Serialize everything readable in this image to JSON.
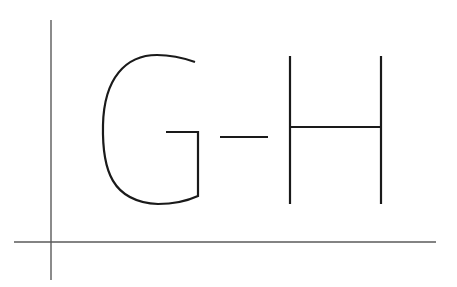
{
  "diagram": {
    "text": "G-H",
    "letters": [
      {
        "char": "G",
        "role": "first-letter"
      },
      {
        "char": "-",
        "role": "hyphen"
      },
      {
        "char": "H",
        "role": "second-letter"
      }
    ],
    "colors": {
      "background": "#ffffff",
      "axis": "#5a5a5a",
      "glyph": "#1a1a1a"
    },
    "axes": {
      "vertical": {
        "x": 51,
        "y1": 20,
        "y2": 280
      },
      "horizontal": {
        "y": 242,
        "x1": 14,
        "x2": 436
      }
    }
  }
}
